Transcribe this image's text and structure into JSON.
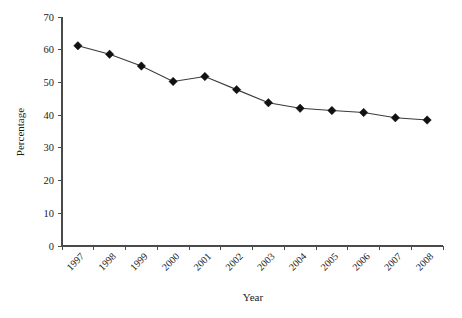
{
  "chart_data": {
    "type": "line",
    "title": "",
    "xlabel": "Year",
    "ylabel": "Percentage",
    "categories": [
      "1997",
      "1998",
      "1999",
      "2000",
      "2001",
      "2002",
      "2003",
      "2004",
      "2005",
      "2006",
      "2007",
      "2008"
    ],
    "values": [
      61.2,
      58.6,
      55.0,
      50.3,
      51.8,
      47.8,
      43.8,
      42.1,
      41.4,
      40.8,
      39.2,
      38.5
    ],
    "ylim": [
      0,
      70
    ],
    "ytick_step": 10,
    "yticks": [
      "0",
      "10",
      "20",
      "30",
      "40",
      "50",
      "60",
      "70"
    ],
    "grid": false,
    "legend": false,
    "legend_position": "none",
    "marker": "diamond",
    "series_color": "#3a3a3a",
    "marker_color": "#111111",
    "axis_color": "#4a4a4a",
    "background_color": "#ffffff",
    "xtick_rotation_deg": 45
  }
}
